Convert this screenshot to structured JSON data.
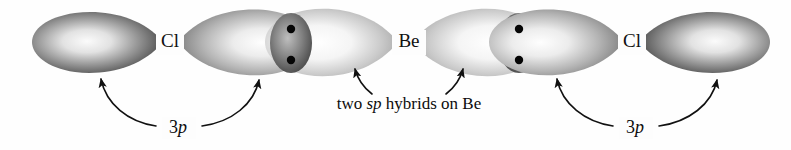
{
  "figure": {
    "kind": "orbital-overlap-diagram",
    "molecule": "BeCl2",
    "width": 791,
    "height": 150,
    "background_color": "#fefefe",
    "ink_color": "#111111"
  },
  "atom_labels": [
    {
      "id": "cl-left",
      "text": "Cl",
      "x": 170,
      "y": 42
    },
    {
      "id": "be-center",
      "text": "Be",
      "x": 409,
      "y": 42
    },
    {
      "id": "cl-right",
      "text": "Cl",
      "x": 632,
      "y": 42
    }
  ],
  "orbital_labels": [
    {
      "id": "p-left",
      "prefix": "3",
      "italic": "p",
      "x": 178,
      "y": 128
    },
    {
      "id": "p-right",
      "prefix": "3",
      "italic": "p",
      "x": 635,
      "y": 128
    }
  ],
  "caption": {
    "id": "sp-hybrid-caption",
    "before": "two ",
    "italic": "sp",
    "after": " hybrids on Be",
    "x": 409,
    "y": 104
  },
  "lobes": [
    {
      "id": "cl-left-3p-outer",
      "type": "p-orbital-lobe",
      "belongs_to": "Cl (left)",
      "shade": "dark",
      "fill_light": "#f2f2f2",
      "fill_dark": "#4a4a4a",
      "direction": "left"
    },
    {
      "id": "cl-left-3p-inner",
      "type": "p-orbital-lobe",
      "belongs_to": "Cl (left)",
      "shade": "mid",
      "fill_light": "#fbfbfb",
      "fill_dark": "#8f8f8f",
      "direction": "right"
    },
    {
      "id": "be-sp-left",
      "type": "sp-hybrid-lobe",
      "belongs_to": "Be",
      "shade": "light",
      "fill_light": "#fdfdfd",
      "fill_dark": "#a8a8a8",
      "direction": "left"
    },
    {
      "id": "be-sp-right",
      "type": "sp-hybrid-lobe",
      "belongs_to": "Be",
      "shade": "light",
      "fill_light": "#fdfdfd",
      "fill_dark": "#a8a8a8",
      "direction": "right"
    },
    {
      "id": "cl-right-3p-inner",
      "type": "p-orbital-lobe",
      "belongs_to": "Cl (right)",
      "shade": "mid",
      "fill_light": "#fbfbfb",
      "fill_dark": "#8f8f8f",
      "direction": "left"
    },
    {
      "id": "cl-right-3p-outer",
      "type": "p-orbital-lobe",
      "belongs_to": "Cl (right)",
      "shade": "dark",
      "fill_light": "#f2f2f2",
      "fill_dark": "#4a4a4a",
      "direction": "right"
    }
  ],
  "electron_dots": [
    {
      "id": "dot-left-pair-top",
      "x": 291,
      "y": 29,
      "r": 4.2,
      "color": "#050505"
    },
    {
      "id": "dot-left-pair-bottom",
      "x": 291,
      "y": 60,
      "r": 4.2,
      "color": "#050505"
    },
    {
      "id": "dot-right-pair-top",
      "x": 519,
      "y": 29,
      "r": 4.2,
      "color": "#050505"
    },
    {
      "id": "dot-right-pair-bottom",
      "x": 519,
      "y": 60,
      "r": 4.2,
      "color": "#050505"
    }
  ],
  "leader_arrows": [
    {
      "id": "arrow-3p-left-outer",
      "points_to": "cl-left-3p-outer",
      "from_label": "p-left"
    },
    {
      "id": "arrow-3p-left-inner",
      "points_to": "cl-left-3p-inner",
      "from_label": "p-left"
    },
    {
      "id": "arrow-sp-left",
      "points_to": "be-sp-left",
      "from_label": "sp-hybrid-caption"
    },
    {
      "id": "arrow-sp-right",
      "points_to": "be-sp-right",
      "from_label": "sp-hybrid-caption"
    },
    {
      "id": "arrow-3p-right-inner",
      "points_to": "cl-right-3p-inner",
      "from_label": "p-right"
    },
    {
      "id": "arrow-3p-right-outer",
      "points_to": "cl-right-3p-outer",
      "from_label": "p-right"
    }
  ]
}
